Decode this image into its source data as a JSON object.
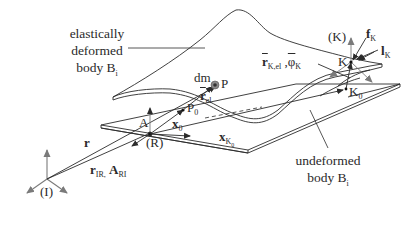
{
  "diagram": {
    "captions": {
      "deformed": {
        "line1": "elastically",
        "line2": "deformed",
        "line3_main": "body B",
        "line3_sub": "i"
      },
      "undeformed": {
        "line1": "undeformed",
        "line2_main": "body B",
        "line2_sub": "i"
      }
    },
    "frames": {
      "inertial": "(I)",
      "reference": "(R)",
      "node": "(K)"
    },
    "points": {
      "A": "A",
      "P": "P",
      "P0_main": "P",
      "P0_sub": "0",
      "K": "K",
      "K0_main": "K",
      "K0_sub": "0"
    },
    "vectors": {
      "r": "r",
      "r_IR_main": "r",
      "r_IR_sub": "IR,",
      "A_RI_main": "A",
      "A_RI_sub": "RI",
      "x0_main": "x",
      "x0_sub": "0",
      "xK0_main": "x",
      "xK0_sub": "K",
      "xK0_subsub": "0",
      "r_el_main": "r",
      "r_el_sub": "el",
      "rK_el_main": "r",
      "rK_el_sub": "K,el",
      "phiK_main": "φ",
      "phiK_sub": "K",
      "fK_main": "f",
      "fK_sub": "K",
      "lK_main": "l",
      "lK_sub": "K",
      "dm": "dm"
    },
    "colors": {
      "line": "#2b2b2b",
      "arrow_gray": "#7a7a7a",
      "mass_fill": "#8a8a8a",
      "background": "#ffffff"
    }
  }
}
